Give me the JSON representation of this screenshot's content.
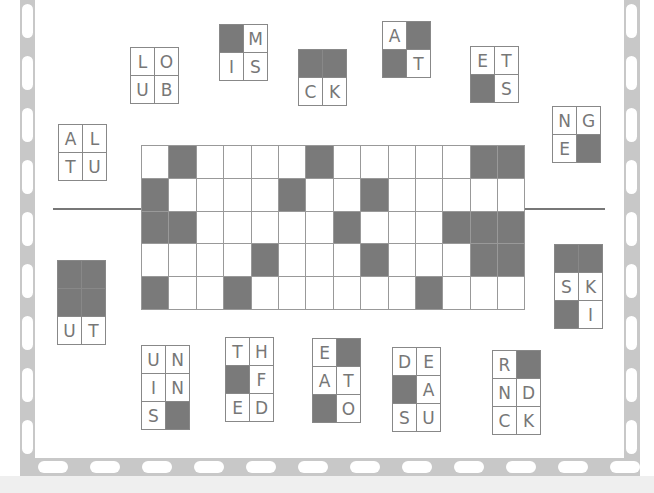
{
  "puzzle": {
    "type": "framework-tiles",
    "grid": {
      "columns": 14,
      "rows": 5,
      "black_cells": [
        [
          0,
          1
        ],
        [
          0,
          6
        ],
        [
          0,
          12
        ],
        [
          0,
          13
        ],
        [
          1,
          0
        ],
        [
          1,
          5
        ],
        [
          1,
          8
        ],
        [
          2,
          0
        ],
        [
          2,
          1
        ],
        [
          2,
          7
        ],
        [
          2,
          11
        ],
        [
          2,
          12
        ],
        [
          2,
          13
        ],
        [
          3,
          4
        ],
        [
          3,
          8
        ],
        [
          3,
          12
        ],
        [
          3,
          13
        ],
        [
          4,
          0
        ],
        [
          4,
          3
        ],
        [
          4,
          10
        ]
      ]
    },
    "tiles": [
      {
        "id": "loub",
        "x": 130,
        "y": 47,
        "cells": [
          [
            "L",
            "O"
          ],
          [
            "U",
            "B"
          ]
        ]
      },
      {
        "id": "mis",
        "x": 219,
        "y": 24,
        "cells": [
          [
            "#",
            "M"
          ],
          [
            "I",
            "S"
          ]
        ]
      },
      {
        "id": "ck",
        "x": 298,
        "y": 49,
        "cells": [
          [
            "#",
            "#"
          ],
          [
            "C",
            "K"
          ]
        ]
      },
      {
        "id": "at",
        "x": 382,
        "y": 21,
        "cells": [
          [
            "A",
            "#"
          ],
          [
            "#",
            "T"
          ]
        ]
      },
      {
        "id": "ets",
        "x": 470,
        "y": 46,
        "cells": [
          [
            "E",
            "T"
          ],
          [
            "#",
            "S"
          ]
        ]
      },
      {
        "id": "nge",
        "x": 552,
        "y": 106,
        "cells": [
          [
            "N",
            "G"
          ],
          [
            "E",
            "#"
          ]
        ]
      },
      {
        "id": "altu",
        "x": 58,
        "y": 124,
        "cells": [
          [
            "A",
            "L"
          ],
          [
            "T",
            "U"
          ]
        ]
      },
      {
        "id": "ut",
        "x": 57,
        "y": 260,
        "cells": [
          [
            "#",
            "#"
          ],
          [
            "#",
            "#"
          ],
          [
            "U",
            "T"
          ]
        ]
      },
      {
        "id": "ski",
        "x": 554,
        "y": 244,
        "cells": [
          [
            "#",
            "#"
          ],
          [
            "S",
            "K"
          ],
          [
            "#",
            "I"
          ]
        ]
      },
      {
        "id": "unins",
        "x": 141,
        "y": 345,
        "cells": [
          [
            "U",
            "N"
          ],
          [
            "I",
            "N"
          ],
          [
            "S",
            "#"
          ]
        ]
      },
      {
        "id": "thfed",
        "x": 225,
        "y": 337,
        "cells": [
          [
            "T",
            "H"
          ],
          [
            "#",
            "F"
          ],
          [
            "E",
            "D"
          ]
        ]
      },
      {
        "id": "eato",
        "x": 312,
        "y": 338,
        "cells": [
          [
            "E",
            "#"
          ],
          [
            "A",
            "T"
          ],
          [
            "#",
            "O"
          ]
        ]
      },
      {
        "id": "deasu",
        "x": 392,
        "y": 347,
        "cells": [
          [
            "D",
            "E"
          ],
          [
            "#",
            "A"
          ],
          [
            "S",
            "U"
          ]
        ]
      },
      {
        "id": "rndck",
        "x": 492,
        "y": 350,
        "cells": [
          [
            "R",
            "#"
          ],
          [
            "N",
            "D"
          ],
          [
            "C",
            "K"
          ]
        ]
      }
    ]
  },
  "colors": {
    "black_cell": "#7a7a7a",
    "border_strip": "#c8c8c8",
    "letter": "#777777"
  },
  "footer": {
    "text": ""
  }
}
